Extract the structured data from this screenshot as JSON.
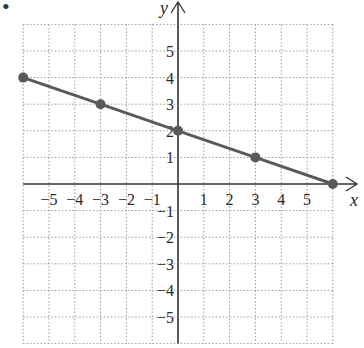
{
  "bullet": "•",
  "chart_data": {
    "type": "line",
    "title": "",
    "xlabel": "x",
    "ylabel": "y",
    "xlim": [
      -6,
      6
    ],
    "ylim": [
      -6,
      6
    ],
    "grid": true,
    "x_ticks": [
      "−5",
      "−4",
      "−3",
      "−2",
      "−1",
      "1",
      "2",
      "3",
      "4",
      "5"
    ],
    "y_ticks": [
      "5",
      "4",
      "3",
      "2",
      "1",
      "−1",
      "−2",
      "−3",
      "−4",
      "−5"
    ],
    "series": [
      {
        "name": "line",
        "color": "#5a5a5a",
        "points": [
          [
            -6,
            4
          ],
          [
            -3,
            3
          ],
          [
            0,
            2
          ],
          [
            3,
            1
          ],
          [
            6,
            0
          ]
        ]
      }
    ]
  }
}
